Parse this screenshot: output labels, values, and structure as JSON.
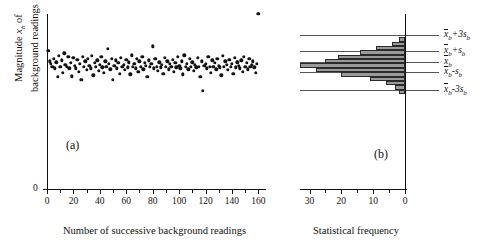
{
  "figure": {
    "panel_a_label": "(a)",
    "panel_b_label": "(b)"
  },
  "panel_a": {
    "ylabel_line1": "Magnitude x",
    "ylabel_sub": "b",
    "ylabel_line1b": " of",
    "ylabel_line2": "background readings",
    "y_zero": "0",
    "xlabel": "Number of successive background readings",
    "xticks": [
      "0",
      "20",
      "40",
      "60",
      "80",
      "100",
      "120",
      "140",
      "160"
    ]
  },
  "panel_b": {
    "xlabel": "Statistical frequency",
    "xticks": [
      "30",
      "20",
      "10",
      "0"
    ],
    "reference_labels": [
      {
        "id": "plus3s",
        "base": "x",
        "sub": "b",
        "op": "+3",
        "s": "s",
        "ssub": "b"
      },
      {
        "id": "plus1s",
        "base": "x",
        "sub": "b",
        "op": "+",
        "s": "s",
        "ssub": "b"
      },
      {
        "id": "mean",
        "base": "x",
        "sub": "b",
        "op": "",
        "s": "",
        "ssub": ""
      },
      {
        "id": "minus1s",
        "base": "x",
        "sub": "b",
        "op": "-",
        "s": "s",
        "ssub": "b"
      },
      {
        "id": "minus3s",
        "base": "x",
        "sub": "b",
        "op": "-3",
        "s": "s",
        "ssub": "b"
      }
    ],
    "reference_text": [
      "x̄b+3sb",
      "x̄b+sb",
      "x̄b",
      "x̄b-sb",
      "x̄b-3sb"
    ]
  },
  "chart_data": {
    "type": "scatter",
    "title": "",
    "panels": [
      {
        "id": "a",
        "type": "scatter",
        "label": "(a)",
        "xlabel": "Number of successive background readings",
        "ylabel": "Magnitude x_b of background readings",
        "xlim": [
          0,
          165
        ],
        "ylim": [
          0,
          1
        ],
        "xticks": [
          0,
          20,
          40,
          60,
          80,
          100,
          120,
          140,
          160
        ],
        "yticks": [
          0
        ],
        "grid": false,
        "note": "y axis shows only the 0 origin label; values are in arbitrary magnitude units",
        "x": [
          1,
          2,
          3,
          4,
          5,
          6,
          7,
          8,
          9,
          10,
          11,
          12,
          13,
          14,
          15,
          16,
          17,
          18,
          19,
          20,
          21,
          22,
          23,
          24,
          25,
          26,
          27,
          28,
          29,
          30,
          31,
          32,
          33,
          34,
          35,
          36,
          37,
          38,
          39,
          40,
          41,
          42,
          43,
          44,
          45,
          46,
          47,
          48,
          49,
          50,
          51,
          52,
          53,
          54,
          55,
          56,
          57,
          58,
          59,
          60,
          61,
          62,
          63,
          64,
          65,
          66,
          67,
          68,
          69,
          70,
          71,
          72,
          73,
          74,
          75,
          76,
          77,
          78,
          79,
          80,
          81,
          82,
          83,
          84,
          85,
          86,
          87,
          88,
          89,
          90,
          91,
          92,
          93,
          94,
          95,
          96,
          97,
          98,
          99,
          100,
          101,
          102,
          103,
          104,
          105,
          106,
          107,
          108,
          109,
          110,
          111,
          112,
          113,
          114,
          115,
          116,
          117,
          118,
          119,
          120,
          121,
          122,
          123,
          124,
          125,
          126,
          127,
          128,
          129,
          130,
          131,
          132,
          133,
          134,
          135,
          136,
          137,
          138,
          139,
          140,
          141,
          142,
          143,
          144,
          145,
          146,
          147,
          148,
          149,
          150,
          151,
          152,
          153,
          154,
          155,
          156,
          157,
          158,
          159,
          160
        ],
        "y": [
          0.79,
          0.73,
          0.715,
          0.7,
          0.745,
          0.69,
          0.725,
          0.64,
          0.76,
          0.7,
          0.735,
          0.665,
          0.775,
          0.71,
          0.7,
          0.755,
          0.69,
          0.72,
          0.645,
          0.75,
          0.705,
          0.69,
          0.74,
          0.67,
          0.715,
          0.625,
          0.755,
          0.7,
          0.73,
          0.68,
          0.745,
          0.705,
          0.69,
          0.76,
          0.65,
          0.72,
          0.7,
          0.735,
          0.675,
          0.71,
          0.755,
          0.695,
          0.665,
          0.73,
          0.7,
          0.8,
          0.715,
          0.685,
          0.745,
          0.625,
          0.705,
          0.735,
          0.69,
          0.72,
          0.66,
          0.75,
          0.7,
          0.71,
          0.68,
          0.74,
          0.695,
          0.725,
          0.655,
          0.765,
          0.7,
          0.715,
          0.69,
          0.745,
          0.67,
          0.73,
          0.7,
          0.755,
          0.685,
          0.72,
          0.705,
          0.64,
          0.735,
          0.7,
          0.715,
          0.815,
          0.69,
          0.745,
          0.7,
          0.675,
          0.725,
          0.695,
          0.71,
          0.66,
          0.75,
          0.7,
          0.73,
          0.685,
          0.715,
          0.7,
          0.74,
          0.67,
          0.72,
          0.695,
          0.755,
          0.705,
          0.69,
          0.73,
          0.655,
          0.765,
          0.7,
          0.715,
          0.685,
          0.745,
          0.7,
          0.725,
          0.675,
          0.71,
          0.695,
          0.75,
          0.7,
          0.64,
          0.73,
          0.56,
          0.705,
          0.715,
          0.69,
          0.755,
          0.7,
          0.665,
          0.735,
          0.7,
          0.72,
          0.685,
          0.745,
          0.705,
          0.695,
          0.65,
          0.76,
          0.7,
          0.73,
          0.71,
          0.68,
          0.74,
          0.7,
          0.715,
          0.66,
          0.75,
          0.695,
          0.725,
          0.705,
          0.69,
          0.735,
          0.67,
          0.755,
          0.7,
          0.72,
          0.685,
          0.745,
          0.7,
          0.71,
          0.73,
          0.695,
          0.665,
          0.715
        ]
      },
      {
        "id": "b",
        "type": "bar",
        "orientation": "horizontal",
        "label": "(b)",
        "xlabel": "Statistical frequency",
        "ylabel": "",
        "xlim": [
          33,
          0
        ],
        "x_reversed": true,
        "xticks": [
          30,
          20,
          10,
          0
        ],
        "grid": false,
        "bin_centers": [
          0.855,
          0.83,
          0.805,
          0.78,
          0.755,
          0.73,
          0.705,
          0.68,
          0.655,
          0.63,
          0.605,
          0.58,
          0.555
        ],
        "frequencies": [
          2,
          4,
          9,
          14,
          21,
          25,
          33,
          28,
          20,
          11,
          6,
          3,
          2
        ],
        "reference_lines": [
          {
            "label": "x̄b+3sb",
            "y": 0.88
          },
          {
            "label": "x̄b+sb",
            "y": 0.79
          },
          {
            "label": "x̄b",
            "y": 0.728
          },
          {
            "label": "x̄b-sb",
            "y": 0.668
          },
          {
            "label": "x̄b-3sb",
            "y": 0.568
          }
        ]
      }
    ]
  },
  "colors": {
    "bar_fill": "#9a9a9a",
    "bar_edge": "#2a2a2a",
    "axis": "#111111",
    "refline": "#555555",
    "background": "#ffffff"
  }
}
